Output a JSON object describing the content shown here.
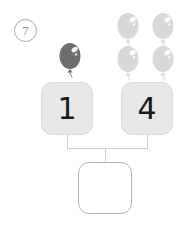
{
  "problem": {
    "number_label": "7",
    "number_shape": "circled"
  },
  "addends": [
    {
      "card_label": "1",
      "balloon_count": 1,
      "balloon_color": "#6e6e6e",
      "balloon_highlight": "#ffffff",
      "balloon_icon": "balloon-icon"
    },
    {
      "card_label": "4",
      "balloon_count": 4,
      "balloon_color": "#d8d8d8",
      "balloon_highlight": "#ffffff",
      "balloon_icon": "balloon-icon"
    }
  ],
  "answer": {
    "value": "",
    "placeholder": ""
  },
  "colors": {
    "card_fill": "#e8e8e8",
    "card_border": "#dcdcdc",
    "connector": "#cfcfcf",
    "answer_border": "#b4b4b4",
    "number_text": "#1a1a1a",
    "problem_number_text": "#8f8f8f",
    "page_background": "#ffffff"
  }
}
